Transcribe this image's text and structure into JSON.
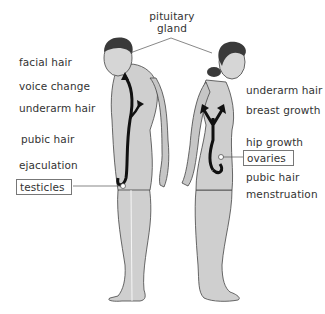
{
  "diagram": {
    "title": "pituitary gland",
    "title_lines": [
      "pituitary",
      "gland"
    ],
    "male": {
      "labels": [
        "facial hair",
        "voice change",
        "underarm hair",
        "pubic hair",
        "ejaculation"
      ],
      "organ": "testicles"
    },
    "female": {
      "labels_upper": [
        "underarm hair",
        "breast growth",
        "hip growth"
      ],
      "organ": "ovaries",
      "labels_lower": [
        "pubic hair",
        "menstruation"
      ]
    },
    "colors": {
      "skin": "#cfcfcf",
      "outline": "#444444",
      "hair": "#3a3a3a",
      "arrow": "#111111",
      "leader": "#555555",
      "box_border": "#777777"
    }
  }
}
